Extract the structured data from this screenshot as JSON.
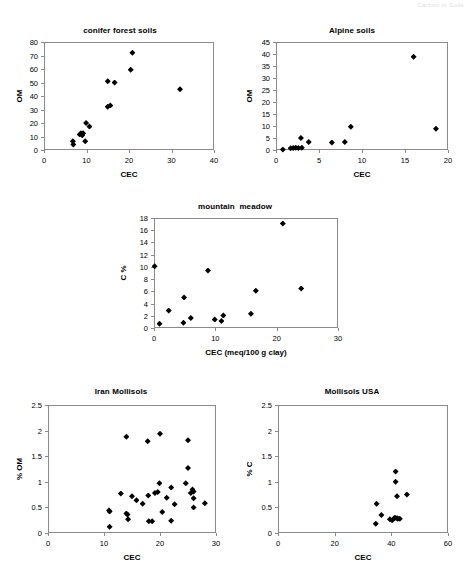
{
  "header": {
    "left_text": "",
    "right_text": "Carbon in Soils"
  },
  "charts": [
    {
      "id": "conifer-forest-soils",
      "title": "conifer forest soils",
      "xlabel": "CEC",
      "ylabel": "OM",
      "xticks": [
        "0",
        "10",
        "20",
        "30",
        "40"
      ],
      "yticks": [
        "0",
        "10",
        "20",
        "30",
        "40",
        "50",
        "60",
        "70",
        "80"
      ]
    },
    {
      "id": "alpine-soils",
      "title": "Alpine soils",
      "xlabel": "CEC",
      "ylabel": "OM",
      "xticks": [
        "0",
        "5",
        "10",
        "15",
        "20"
      ],
      "yticks": [
        "0",
        "5",
        "10",
        "15",
        "20",
        "25",
        "30",
        "35",
        "40",
        "45"
      ]
    },
    {
      "id": "mountain-meadow",
      "title": "mountain  meadow",
      "xlabel": "CEC (meq/100 g clay)",
      "ylabel": "C %",
      "xticks": [
        "0",
        "10",
        "20",
        "30"
      ],
      "yticks": [
        "0",
        "2",
        "4",
        "6",
        "8",
        "10",
        "12",
        "14",
        "16",
        "18"
      ]
    },
    {
      "id": "iran-mollisols",
      "title": "Iran Mollisols",
      "xlabel": "CEC",
      "ylabel": "% OM",
      "xticks": [
        "0",
        "10",
        "20",
        "30"
      ],
      "yticks": [
        "0",
        "0.5",
        "1",
        "1.5",
        "2",
        "2.5"
      ]
    },
    {
      "id": "mollisols-usa",
      "title": "Mollisols USA",
      "xlabel": "CEC",
      "ylabel": "% C",
      "xticks": [
        "0",
        "20",
        "40",
        "60"
      ],
      "yticks": [
        "0",
        "0.5",
        "1",
        "1.5",
        "2",
        "2.5"
      ]
    }
  ],
  "chart_data": [
    {
      "type": "scatter",
      "id": "conifer-forest-soils",
      "title": "conifer forest soils",
      "xlabel": "CEC",
      "ylabel": "OM",
      "xlim": [
        0,
        40
      ],
      "ylim": [
        0,
        80
      ],
      "xticks": [
        0,
        10,
        20,
        30,
        40
      ],
      "yticks": [
        0,
        10,
        20,
        30,
        40,
        50,
        60,
        70,
        80
      ],
      "grid": false,
      "legend": "none",
      "marker": "filled-diamond",
      "points": [
        [
          6.8,
          6.5
        ],
        [
          6.9,
          4.0
        ],
        [
          8.4,
          11.5
        ],
        [
          8.7,
          12.5
        ],
        [
          9.0,
          11.0
        ],
        [
          9.2,
          12.5
        ],
        [
          9.9,
          20.0
        ],
        [
          9.7,
          6.5
        ],
        [
          10.7,
          17.5
        ],
        [
          15.0,
          32.0
        ],
        [
          15.6,
          33.0
        ],
        [
          15.0,
          51.0
        ],
        [
          16.6,
          50.0
        ],
        [
          20.4,
          59.5
        ],
        [
          20.8,
          72.0
        ],
        [
          32.0,
          45.0
        ]
      ]
    },
    {
      "type": "scatter",
      "id": "alpine-soils",
      "title": "Alpine soils",
      "xlabel": "CEC",
      "ylabel": "OM",
      "xlim": [
        0,
        20
      ],
      "ylim": [
        0,
        45
      ],
      "xticks": [
        0,
        5,
        10,
        15,
        20
      ],
      "yticks": [
        0,
        5,
        10,
        15,
        20,
        25,
        30,
        35,
        40,
        45
      ],
      "grid": false,
      "legend": "none",
      "marker": "filled-diamond",
      "points": [
        [
          0.8,
          0.2
        ],
        [
          1.7,
          0.7
        ],
        [
          2.0,
          0.8
        ],
        [
          2.3,
          0.9
        ],
        [
          2.6,
          0.8
        ],
        [
          2.9,
          5.0
        ],
        [
          3.0,
          0.9
        ],
        [
          3.8,
          3.3
        ],
        [
          6.5,
          3.1
        ],
        [
          8.0,
          3.3
        ],
        [
          8.7,
          9.7
        ],
        [
          16.0,
          38.9
        ],
        [
          18.6,
          8.9
        ]
      ]
    },
    {
      "type": "scatter",
      "id": "mountain-meadow",
      "title": "mountain  meadow",
      "xlabel": "CEC (meq/100 g clay)",
      "ylabel": "C %",
      "xlim": [
        0,
        30
      ],
      "ylim": [
        0,
        18
      ],
      "xticks": [
        0,
        10,
        20,
        30
      ],
      "yticks": [
        0,
        2,
        4,
        6,
        8,
        10,
        12,
        14,
        16,
        18
      ],
      "grid": false,
      "legend": "none",
      "marker": "filled-diamond",
      "points": [
        [
          0.1,
          10.1
        ],
        [
          0.9,
          0.7
        ],
        [
          2.4,
          2.85
        ],
        [
          4.9,
          5.0
        ],
        [
          4.8,
          0.85
        ],
        [
          6.0,
          1.65
        ],
        [
          8.8,
          9.4
        ],
        [
          9.9,
          1.4
        ],
        [
          11.0,
          1.15
        ],
        [
          11.3,
          2.05
        ],
        [
          15.8,
          2.35
        ],
        [
          16.6,
          6.1
        ],
        [
          21.0,
          17.1
        ],
        [
          24.0,
          6.45
        ]
      ]
    },
    {
      "type": "scatter",
      "id": "iran-mollisols",
      "title": "Iran Mollisols",
      "xlabel": "CEC",
      "ylabel": "% OM",
      "xlim": [
        0,
        30
      ],
      "ylim": [
        0,
        2.5
      ],
      "xticks": [
        0,
        10,
        20,
        30
      ],
      "yticks": [
        0,
        0.5,
        1,
        1.5,
        2,
        2.5
      ],
      "grid": false,
      "legend": "none",
      "marker": "filled-diamond",
      "points": [
        [
          10.9,
          0.44
        ],
        [
          11.0,
          0.42
        ],
        [
          11.0,
          0.12
        ],
        [
          13.0,
          0.77
        ],
        [
          14.0,
          1.88
        ],
        [
          14.0,
          0.38
        ],
        [
          14.2,
          0.36
        ],
        [
          14.3,
          0.27
        ],
        [
          15.0,
          0.72
        ],
        [
          15.8,
          0.64
        ],
        [
          16.9,
          0.57
        ],
        [
          17.8,
          1.79
        ],
        [
          17.9,
          0.73
        ],
        [
          18.0,
          0.23
        ],
        [
          18.6,
          0.23
        ],
        [
          19.1,
          0.78
        ],
        [
          19.6,
          0.8
        ],
        [
          19.9,
          0.97
        ],
        [
          20.0,
          1.94
        ],
        [
          20.4,
          0.41
        ],
        [
          21.2,
          0.69
        ],
        [
          22.0,
          0.89
        ],
        [
          22.0,
          0.24
        ],
        [
          22.6,
          0.56
        ],
        [
          24.6,
          0.97
        ],
        [
          25.0,
          1.81
        ],
        [
          25.0,
          1.27
        ],
        [
          25.5,
          0.78
        ],
        [
          25.8,
          0.85
        ],
        [
          26.0,
          0.81
        ],
        [
          26.0,
          0.68
        ],
        [
          26.0,
          0.5
        ],
        [
          28.0,
          0.58
        ]
      ]
    },
    {
      "type": "scatter",
      "id": "mollisols-usa",
      "title": "Mollisols USA",
      "xlabel": "CEC",
      "ylabel": "% C",
      "xlim": [
        0,
        60
      ],
      "ylim": [
        0,
        2.5
      ],
      "xticks": [
        0,
        20,
        40,
        60
      ],
      "yticks": [
        0,
        0.5,
        1,
        1.5,
        2,
        2.5
      ],
      "grid": false,
      "legend": "none",
      "marker": "filled-diamond",
      "points": [
        [
          34.5,
          0.18
        ],
        [
          34.8,
          0.57
        ],
        [
          36.5,
          0.35
        ],
        [
          39.5,
          0.27
        ],
        [
          40.3,
          0.25
        ],
        [
          41.0,
          0.29
        ],
        [
          41.3,
          0.3
        ],
        [
          41.5,
          1.2
        ],
        [
          41.5,
          1.0
        ],
        [
          42.0,
          0.29
        ],
        [
          42.3,
          0.28
        ],
        [
          42.0,
          0.72
        ],
        [
          43.0,
          0.28
        ],
        [
          45.5,
          0.75
        ]
      ]
    }
  ]
}
